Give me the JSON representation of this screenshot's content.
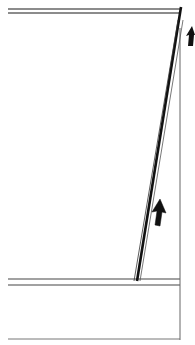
{
  "diagram": {
    "colors": {
      "background": "#ffffff",
      "stroke": "#1a1a1a",
      "light_stroke": "#555555"
    },
    "top_band": {
      "y1": 9,
      "y2": 13,
      "x_start": 8,
      "x_end": 180
    },
    "bottom_band": {
      "y1": 279,
      "y2": 285,
      "x_start": 8,
      "x_end": 180
    },
    "bottom_box_line": {
      "y": 339,
      "x_start": 8,
      "x_end": 180
    },
    "right_edge": {
      "x": 180,
      "y_start": 28,
      "y_end": 340
    },
    "slanted_member": {
      "top": [
        181,
        8
      ],
      "bottom": [
        136,
        281
      ]
    },
    "arrows": [
      {
        "name": "arrow-up-middle",
        "x": 157,
        "y": 200,
        "direction": "up"
      },
      {
        "name": "arrow-up-top-right",
        "x": 190,
        "y": 28,
        "direction": "up"
      }
    ]
  }
}
